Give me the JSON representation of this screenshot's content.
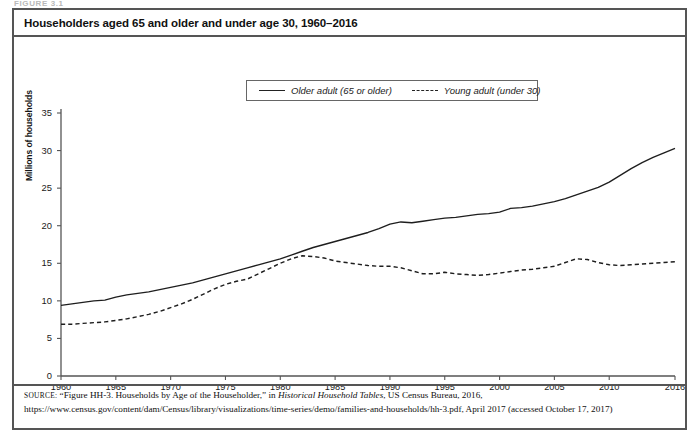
{
  "figure": {
    "label": "FIGURE 3.1",
    "title": "Householders aged 65 and older and under age 30, 1960–2016"
  },
  "legend": {
    "series": [
      {
        "label": "Older adult (65 or older)",
        "style": "solid"
      },
      {
        "label": "Young adult (under 30)",
        "style": "dashed"
      }
    ]
  },
  "axes": {
    "ylabel": "Millions of households",
    "yticks": [
      "0",
      "5",
      "10",
      "15",
      "20",
      "25",
      "30",
      "35"
    ],
    "xticks": [
      "1960",
      "1965",
      "1970",
      "1975",
      "1980",
      "1985",
      "1990",
      "1995",
      "2000",
      "2005",
      "2010",
      "2016"
    ]
  },
  "source": {
    "kicker": "SOURCE:",
    "text_part1": " “Figure HH-3. Households by Age of the Householder,” in ",
    "italic1": "Historical Household Tables",
    "text_part2": ", US Census Bureau, 2016, https://www.census.gov/content/dam/Census/library/visualizations/time-series/demo/families-and-households/hh-3.pdf, April 2017 (accessed October 17, 2017)"
  },
  "chart_data": {
    "type": "line",
    "title": "Householders aged 65 and older and under age 30, 1960–2016",
    "xlabel": "",
    "ylabel": "Millions of households",
    "xlim": [
      1960,
      2016
    ],
    "ylim": [
      0,
      35
    ],
    "grid": false,
    "legend_position": "top-center",
    "x": [
      1960,
      1961,
      1962,
      1963,
      1964,
      1965,
      1966,
      1967,
      1968,
      1969,
      1970,
      1971,
      1972,
      1973,
      1974,
      1975,
      1976,
      1977,
      1978,
      1979,
      1980,
      1981,
      1982,
      1983,
      1984,
      1985,
      1986,
      1987,
      1988,
      1989,
      1990,
      1991,
      1992,
      1993,
      1994,
      1995,
      1996,
      1997,
      1998,
      1999,
      2000,
      2001,
      2002,
      2003,
      2004,
      2005,
      2006,
      2007,
      2008,
      2009,
      2010,
      2011,
      2012,
      2013,
      2014,
      2015,
      2016
    ],
    "series": [
      {
        "name": "Older adult (65 or older)",
        "style": "solid",
        "values": [
          9.4,
          9.6,
          9.8,
          10.0,
          10.1,
          10.5,
          10.8,
          11.0,
          11.2,
          11.5,
          11.8,
          12.1,
          12.4,
          12.8,
          13.2,
          13.6,
          14.0,
          14.4,
          14.8,
          15.2,
          15.6,
          16.1,
          16.6,
          17.1,
          17.5,
          17.9,
          18.3,
          18.7,
          19.1,
          19.6,
          20.2,
          20.5,
          20.4,
          20.6,
          20.8,
          21.0,
          21.1,
          21.3,
          21.5,
          21.6,
          21.8,
          22.3,
          22.4,
          22.6,
          22.9,
          23.2,
          23.6,
          24.1,
          24.6,
          25.1,
          25.8,
          26.7,
          27.6,
          28.4,
          29.1,
          29.7,
          30.3
        ]
      },
      {
        "name": "Young adult (under 30)",
        "style": "dashed",
        "values": [
          6.9,
          6.9,
          7.0,
          7.1,
          7.2,
          7.4,
          7.6,
          7.9,
          8.2,
          8.6,
          9.1,
          9.6,
          10.2,
          10.9,
          11.6,
          12.2,
          12.6,
          12.9,
          13.6,
          14.3,
          15.0,
          15.6,
          16.0,
          15.9,
          15.7,
          15.3,
          15.1,
          14.9,
          14.7,
          14.6,
          14.6,
          14.4,
          14.0,
          13.6,
          13.6,
          13.8,
          13.6,
          13.5,
          13.4,
          13.5,
          13.7,
          13.9,
          14.1,
          14.2,
          14.4,
          14.6,
          15.1,
          15.6,
          15.5,
          15.1,
          14.8,
          14.7,
          14.8,
          14.9,
          15.0,
          15.1,
          15.2
        ]
      }
    ]
  }
}
